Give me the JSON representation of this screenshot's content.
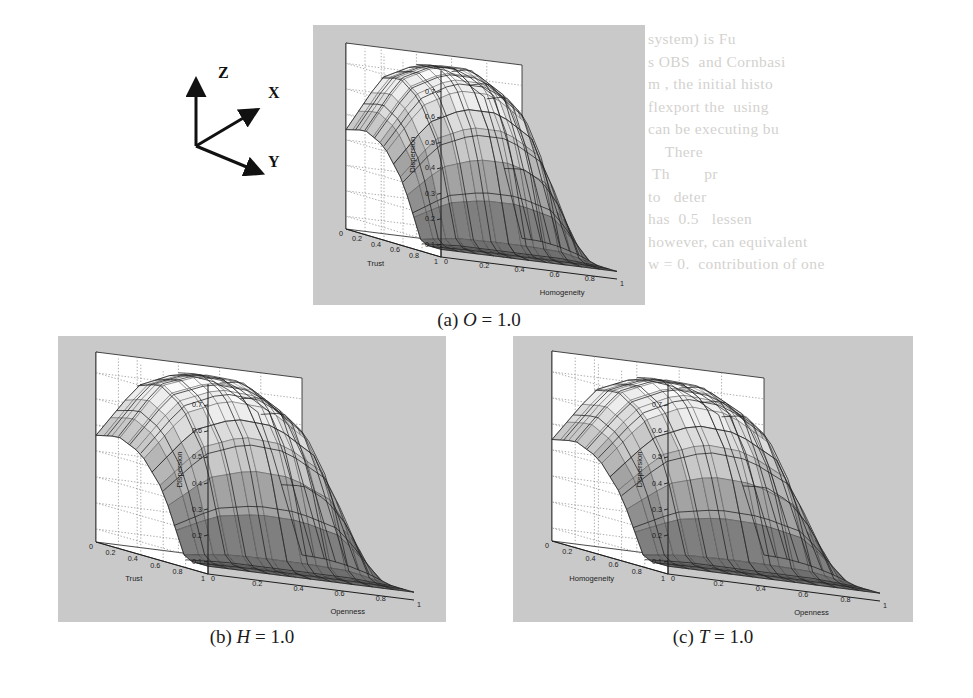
{
  "figure": {
    "kind": "three-panel 3d surface plot figure (scanned journal page)",
    "background_color": "#ffffff",
    "plot_background_color": "#c9c9c9",
    "wall_color": "#ffffff",
    "line_color": "#1d1d1d"
  },
  "axis_triad": {
    "name": "orientation-key",
    "z_label": "Z",
    "x_label": "X",
    "y_label": "Y"
  },
  "panels": [
    {
      "id": "a",
      "caption_prefix": "(a)",
      "caption_var": "O",
      "caption_eq": " = 1.0",
      "caption_full": "(a) O = 1.0",
      "left_axis_label": "Trust",
      "right_axis_label": "Homogeneity",
      "z_axis_label": "Dispersion"
    },
    {
      "id": "b",
      "caption_prefix": "(b)",
      "caption_var": "H",
      "caption_eq": " = 1.0",
      "caption_full": "(b) H = 1.0",
      "left_axis_label": "Trust",
      "right_axis_label": "Openness",
      "z_axis_label": "Dispersion"
    },
    {
      "id": "c",
      "caption_prefix": "(c)",
      "caption_var": "T",
      "caption_eq": " = 1.0",
      "caption_full": "(c) T = 1.0",
      "left_axis_label": "Homogeneity",
      "right_axis_label": "Openness",
      "z_axis_label": "Dispersion"
    }
  ],
  "ghost_text": {
    "right_block": "system) is Fu\ns OBS and Consider\nm, the initial histo\nflexport the  using\ncan be executing bu\n   There \nTh  pr\nto deter\nhas  0.5  lessen\nhowever, can equivalent\nw = 0. contribution of one",
    "left_block": "",
    "bottom_block": ""
  },
  "chart_data": {
    "type": "surface",
    "common": {
      "zlabel": "Dispersion",
      "z_ticks": [
        0.1,
        0.2,
        0.3,
        0.4,
        0.5,
        0.6,
        0.7
      ],
      "zlim": [
        0.05,
        0.78
      ],
      "x_ticks": [
        0,
        0.2,
        0.4,
        0.6,
        0.8,
        1
      ],
      "y_ticks": [
        0,
        0.2,
        0.4,
        0.6,
        0.8,
        1
      ],
      "xlim": [
        0,
        1
      ],
      "ylim": [
        0,
        1
      ],
      "grid": true,
      "grid_style": "dotted",
      "colormap": "grayscale-banded",
      "mesh": true,
      "view": "3d azimuth ~-37.5 elevation ~30"
    },
    "panels": [
      {
        "id": "a",
        "title": "(a) O = 1.0",
        "xlabel": "Trust",
        "ylabel": "Homogeneity",
        "zlabel": "Dispersion",
        "x": [
          0,
          0.2,
          0.4,
          0.6,
          0.8,
          1.0
        ],
        "y": [
          0,
          0.2,
          0.4,
          0.6,
          0.8,
          1.0
        ],
        "z": [
          [
            0.08,
            0.08,
            0.08,
            0.08,
            0.08,
            0.08
          ],
          [
            0.08,
            0.09,
            0.09,
            0.09,
            0.09,
            0.08
          ],
          [
            0.3,
            0.46,
            0.52,
            0.52,
            0.44,
            0.1
          ],
          [
            0.42,
            0.62,
            0.7,
            0.7,
            0.6,
            0.11
          ],
          [
            0.46,
            0.68,
            0.75,
            0.75,
            0.66,
            0.11
          ],
          [
            0.44,
            0.66,
            0.73,
            0.72,
            0.63,
            0.1
          ]
        ]
      },
      {
        "id": "b",
        "title": "(b) H = 1.0",
        "xlabel": "Trust",
        "ylabel": "Openness",
        "zlabel": "Dispersion",
        "x": [
          0,
          0.2,
          0.4,
          0.6,
          0.8,
          1.0
        ],
        "y": [
          0,
          0.2,
          0.4,
          0.6,
          0.8,
          1.0
        ],
        "z": [
          [
            0.08,
            0.08,
            0.08,
            0.08,
            0.08,
            0.08
          ],
          [
            0.08,
            0.09,
            0.09,
            0.09,
            0.09,
            0.08
          ],
          [
            0.32,
            0.48,
            0.54,
            0.53,
            0.44,
            0.1
          ],
          [
            0.44,
            0.64,
            0.71,
            0.7,
            0.59,
            0.11
          ],
          [
            0.48,
            0.7,
            0.76,
            0.75,
            0.65,
            0.11
          ],
          [
            0.46,
            0.67,
            0.74,
            0.72,
            0.62,
            0.1
          ]
        ]
      },
      {
        "id": "c",
        "title": "(c) T = 1.0",
        "xlabel": "Homogeneity",
        "ylabel": "Openness",
        "zlabel": "Dispersion",
        "x": [
          0,
          0.2,
          0.4,
          0.6,
          0.8,
          1.0
        ],
        "y": [
          0,
          0.2,
          0.4,
          0.6,
          0.8,
          1.0
        ],
        "z": [
          [
            0.08,
            0.08,
            0.08,
            0.08,
            0.08,
            0.08
          ],
          [
            0.08,
            0.09,
            0.09,
            0.09,
            0.09,
            0.08
          ],
          [
            0.3,
            0.45,
            0.51,
            0.5,
            0.42,
            0.1
          ],
          [
            0.42,
            0.61,
            0.69,
            0.68,
            0.58,
            0.11
          ],
          [
            0.46,
            0.67,
            0.74,
            0.73,
            0.64,
            0.11
          ],
          [
            0.44,
            0.65,
            0.72,
            0.7,
            0.61,
            0.1
          ]
        ]
      }
    ]
  }
}
